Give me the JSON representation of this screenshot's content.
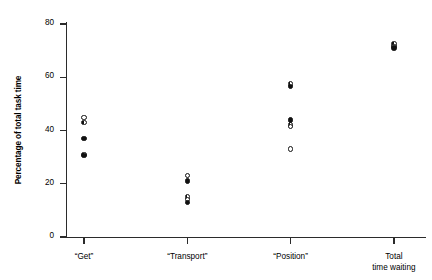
{
  "chart_data": {
    "type": "scatter",
    "title": "",
    "xlabel": "",
    "ylabel": "Percentage of total task time",
    "ylim": [
      0,
      80
    ],
    "yticks": [
      0,
      20,
      40,
      60,
      80
    ],
    "ytick_labels": [
      "0",
      "20",
      "40",
      "60",
      "80"
    ],
    "grid": false,
    "legend": "none",
    "categories": [
      "“Get”",
      "“Transport”",
      "“Position”",
      "Total\ntime waiting"
    ],
    "category_positions": [
      1,
      2,
      3,
      4
    ],
    "groups": [
      {
        "category": "“Get”",
        "points": [
          {
            "value": 45.0,
            "marker": "open"
          },
          {
            "value": 43.0,
            "marker": "half"
          },
          {
            "value": 37.0,
            "marker": "filled"
          },
          {
            "value": 31.0,
            "marker": "half"
          },
          {
            "value": 30.5,
            "marker": "filled"
          }
        ]
      },
      {
        "category": "“Transport”",
        "points": [
          {
            "value": 23.0,
            "marker": "open"
          },
          {
            "value": 21.0,
            "marker": "filled"
          },
          {
            "value": 15.0,
            "marker": "half"
          },
          {
            "value": 14.0,
            "marker": "open"
          },
          {
            "value": 13.0,
            "marker": "filled"
          }
        ]
      },
      {
        "category": "“Position”",
        "points": [
          {
            "value": 57.5,
            "marker": "half"
          },
          {
            "value": 56.5,
            "marker": "filled"
          },
          {
            "value": 44.0,
            "marker": "filled"
          },
          {
            "value": 42.0,
            "marker": "half"
          },
          {
            "value": 41.5,
            "marker": "open"
          },
          {
            "value": 33.0,
            "marker": "open"
          }
        ]
      },
      {
        "category": "Total\ntime waiting",
        "points": [
          {
            "value": 72.5,
            "marker": "half"
          },
          {
            "value": 71.5,
            "marker": "open"
          },
          {
            "value": 71.0,
            "marker": "filled"
          }
        ]
      }
    ],
    "colors": {
      "axis": "#2b2b2b",
      "marker_fill": "#111111",
      "marker_edge": "#111111",
      "background": "#ffffff"
    }
  }
}
